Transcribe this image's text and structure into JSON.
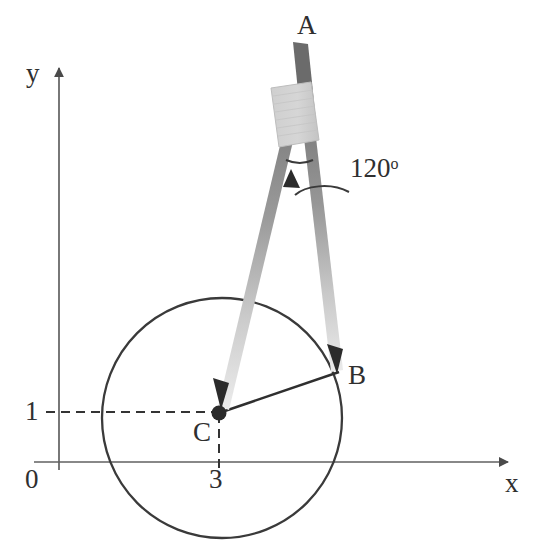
{
  "figure": {
    "background_color": "#ffffff",
    "ink_color": "#2f2f2f",
    "axis_color": "#555555",
    "axes": {
      "y_axis_label": "y",
      "x_axis_label": "x",
      "origin_label": "0",
      "y_tick_label": "1",
      "x_tick_label": "3",
      "y_axis_x_px": 59,
      "x_axis_y_px": 462,
      "y_axis_top_px": 56,
      "x_axis_right_px": 519
    },
    "points": [
      {
        "name": "A",
        "label": "A",
        "role": "compass-top-handle",
        "x_px": 308,
        "y_px": 26
      },
      {
        "name": "B",
        "label": "B",
        "role": "compass-pencil-tip-on-circle",
        "x_px": 337,
        "y_px": 374
      },
      {
        "name": "C",
        "label": "C",
        "role": "compass-needle-center",
        "x_px": 219,
        "y_px": 413
      }
    ],
    "circle": {
      "center_x_px": 222,
      "center_y_px": 418,
      "radius_px": 120,
      "center_coords": {
        "x": 3,
        "y": 1
      },
      "stroke": "#333333",
      "stroke_width": 2.2
    },
    "angle_annotation": {
      "value": "120",
      "degree_symbol": "o",
      "full_label": "120o",
      "leader_arrow": true
    },
    "compass": {
      "head_color": "#d2d2d2",
      "head_edge_color": "#b5b5b5",
      "shaft_color": "#6e6e6e",
      "leg_color_top": "#8a8a8a",
      "leg_color_bottom": "#e8e8e8",
      "pivot_x_px": 300,
      "pivot_y_px": 141
    },
    "dashed_guides": {
      "color": "#333333",
      "dash": "8 6",
      "horizontal_from_x_px": 46,
      "horizontal_y_px": 412,
      "vertical_from_y_px": 413,
      "vertical_to_y_px": 470
    }
  }
}
